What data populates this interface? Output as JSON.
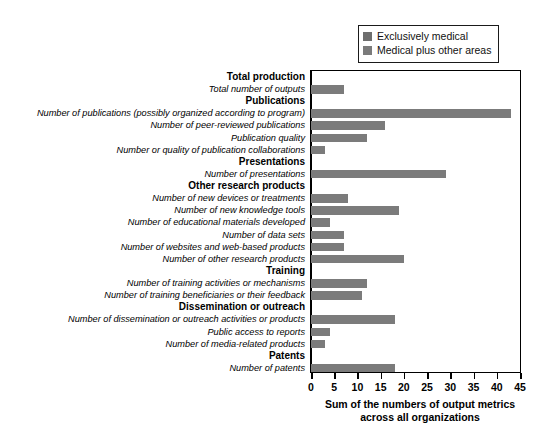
{
  "chart_data": {
    "type": "bar",
    "orientation": "horizontal",
    "title": "",
    "xlabel": "Sum of the numbers of output metrics across all organizations",
    "ylabel": "",
    "xlim": [
      0,
      45
    ],
    "xticks": [
      0,
      5,
      10,
      15,
      20,
      25,
      30,
      35,
      40,
      45
    ],
    "grid": false,
    "legend_position": "top-right",
    "legend": [
      {
        "name": "Exclusively medical",
        "color": "#6e6e6e"
      },
      {
        "name": "Medical plus other areas",
        "color": "#7b7b7b"
      }
    ],
    "series": [
      {
        "name": "Medical plus other areas",
        "color": "#7b7b7b"
      }
    ],
    "rows": [
      {
        "label": "Total production",
        "type": "header"
      },
      {
        "label": "Total number of outputs",
        "type": "metric",
        "value": 7
      },
      {
        "label": "Publications",
        "type": "header"
      },
      {
        "label": "Number of publications (possibly organized according to program)",
        "type": "metric",
        "value": 43
      },
      {
        "label": "Number of peer-reviewed publications",
        "type": "metric",
        "value": 16
      },
      {
        "label": "Publication quality",
        "type": "metric",
        "value": 12
      },
      {
        "label": "Number or quality of publication collaborations",
        "type": "metric",
        "value": 3
      },
      {
        "label": "Presentations",
        "type": "header"
      },
      {
        "label": "Number of presentations",
        "type": "metric",
        "value": 29
      },
      {
        "label": "Other research products",
        "type": "header"
      },
      {
        "label": "Number of new devices or treatments",
        "type": "metric",
        "value": 8
      },
      {
        "label": "Number of new knowledge tools",
        "type": "metric",
        "value": 19
      },
      {
        "label": "Number of educational materials developed",
        "type": "metric",
        "value": 4
      },
      {
        "label": "Number of data sets",
        "type": "metric",
        "value": 7
      },
      {
        "label": "Number of websites and web-based products",
        "type": "metric",
        "value": 7
      },
      {
        "label": "Number of other research products",
        "type": "metric",
        "value": 20
      },
      {
        "label": "Training",
        "type": "header"
      },
      {
        "label": "Number of training activities or mechanisms",
        "type": "metric",
        "value": 12
      },
      {
        "label": "Number of training beneficiaries or their feedback",
        "type": "metric",
        "value": 11
      },
      {
        "label": "Dissemination or outreach",
        "type": "header"
      },
      {
        "label": "Number of dissemination or outreach activities or products",
        "type": "metric",
        "value": 18
      },
      {
        "label": "Public access to reports",
        "type": "metric",
        "value": 4
      },
      {
        "label": "Number of media-related products",
        "type": "metric",
        "value": 3
      },
      {
        "label": "Patents",
        "type": "header"
      },
      {
        "label": "Number of patents",
        "type": "metric",
        "value": 18
      }
    ]
  },
  "axis": {
    "title_line1": "Sum of the numbers of output metrics",
    "title_line2": "across all organizations"
  }
}
